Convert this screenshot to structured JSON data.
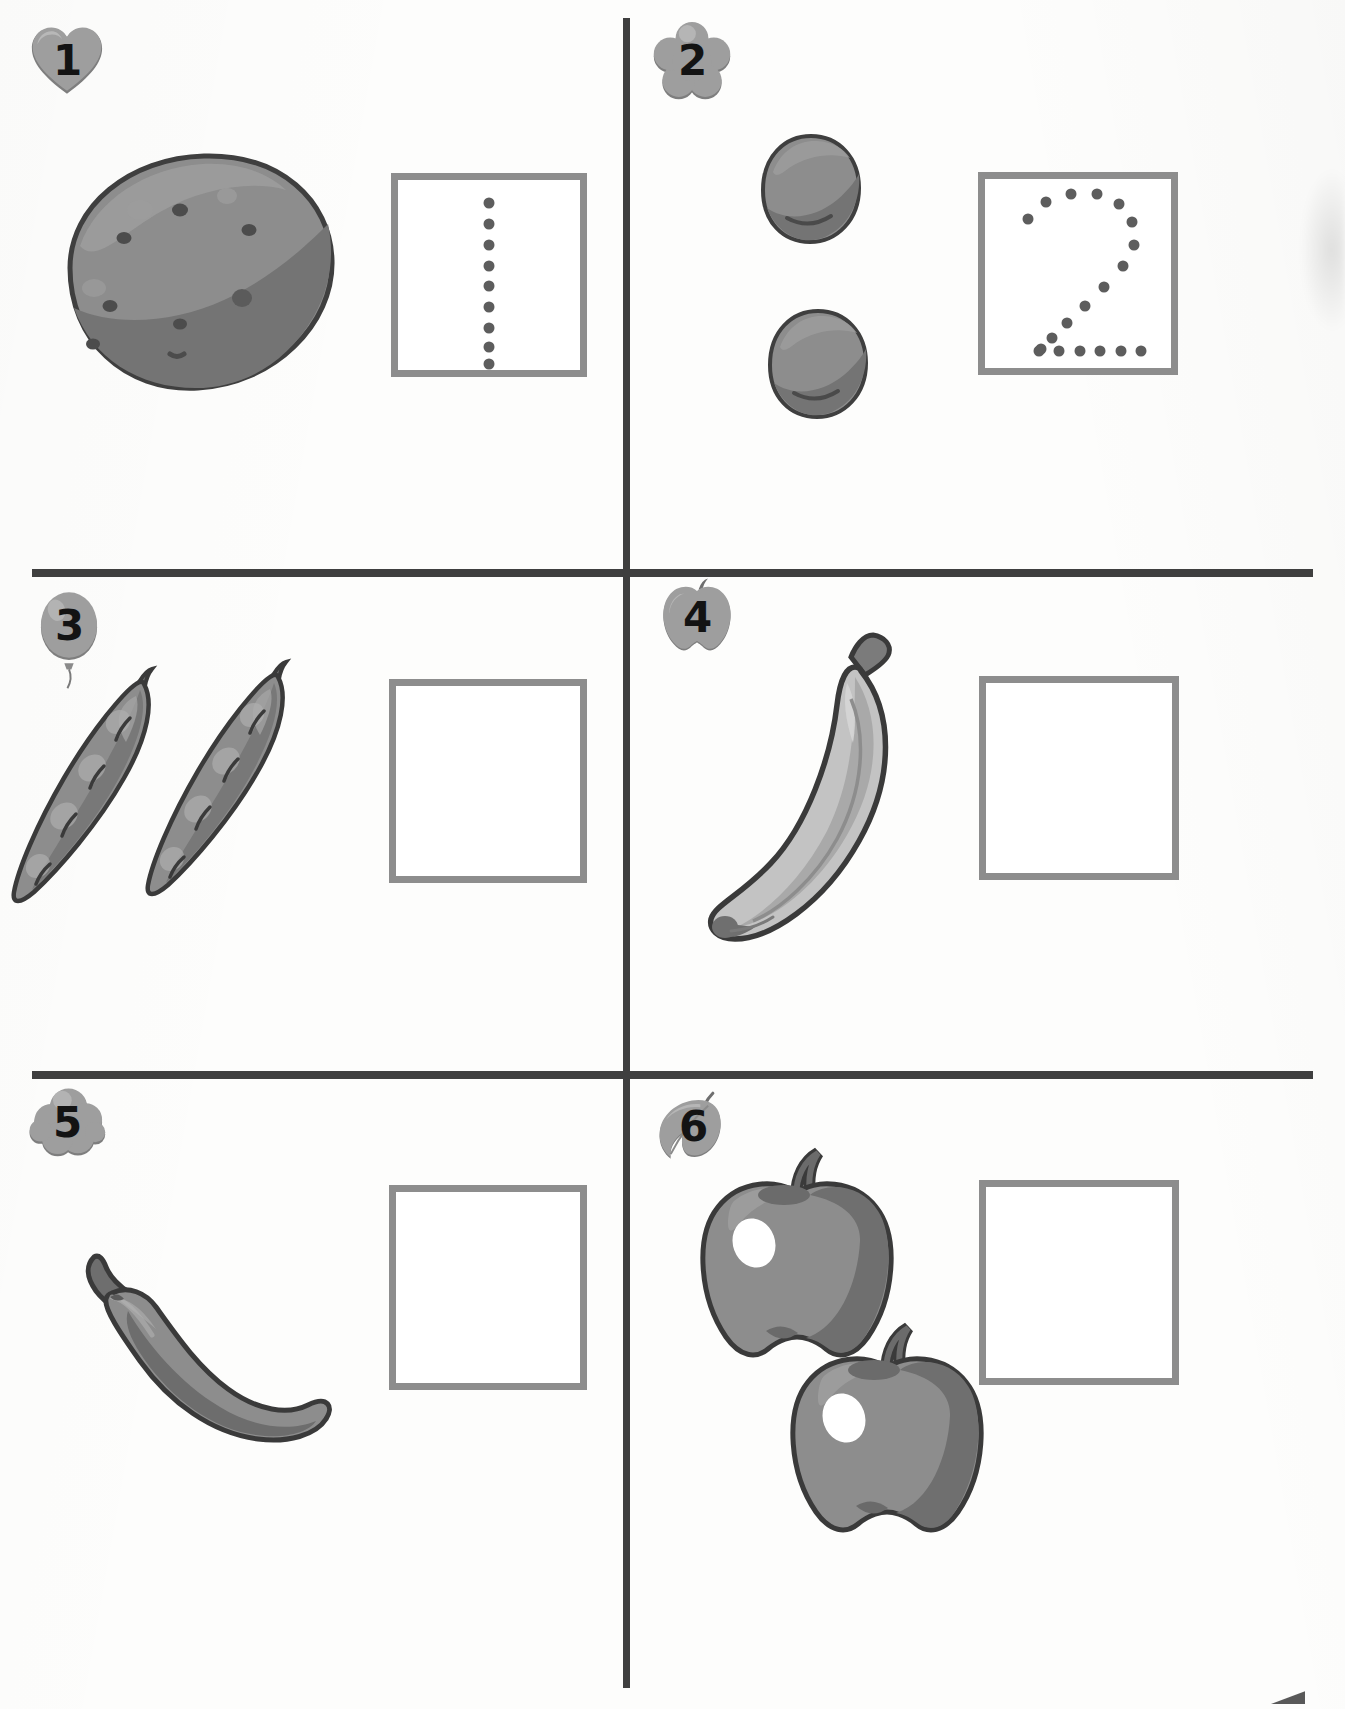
{
  "worksheet": {
    "title": "Count and write the number",
    "columns": 2,
    "rows": 3,
    "colors": {
      "rule": "#3f3f3f",
      "box_border": "#8d8d8d",
      "trace_dot": "#5d5d5d",
      "badge_fill": "#9a9a9a",
      "badge_light": "#b4b4b4",
      "badge_shadow": "#7b7b7b",
      "produce_mid": "#8d8d8d",
      "produce_dark": "#6f6f6f",
      "produce_light": "#bdbdbd",
      "outline": "#3a3a3a",
      "paper": "#fdfdfc"
    }
  },
  "cells": [
    {
      "id": "cell-1",
      "number": "1",
      "badge_shape": "heart",
      "item_name": "potato",
      "item_count": 1,
      "box_has_trace": true,
      "trace_digit": "1",
      "trace_dots": [
        [
          50,
          12
        ],
        [
          50,
          23
        ],
        [
          50,
          34
        ],
        [
          50,
          45
        ],
        [
          50,
          56
        ],
        [
          50,
          67
        ],
        [
          50,
          78
        ],
        [
          50,
          88
        ],
        [
          50,
          97
        ]
      ]
    },
    {
      "id": "cell-2",
      "number": "2",
      "badge_shape": "flower",
      "item_name": "plum",
      "item_count": 2,
      "box_has_trace": true,
      "trace_digit": "2",
      "trace_dots": [
        [
          23,
          21
        ],
        [
          33,
          12
        ],
        [
          46,
          8
        ],
        [
          60,
          8
        ],
        [
          72,
          13
        ],
        [
          79,
          23
        ],
        [
          80,
          35
        ],
        [
          74,
          46
        ],
        [
          64,
          57
        ],
        [
          54,
          67
        ],
        [
          44,
          76
        ],
        [
          36,
          84
        ],
        [
          30,
          90
        ],
        [
          29,
          91
        ],
        [
          40,
          91
        ],
        [
          51,
          91
        ],
        [
          62,
          91
        ],
        [
          73,
          91
        ],
        [
          84,
          91
        ]
      ]
    },
    {
      "id": "cell-3",
      "number": "3",
      "badge_shape": "balloon",
      "item_name": "pea-pod",
      "item_count": 2,
      "box_has_trace": false,
      "trace_digit": "",
      "trace_dots": []
    },
    {
      "id": "cell-4",
      "number": "4",
      "badge_shape": "apple",
      "item_name": "banana",
      "item_count": 1,
      "box_has_trace": false,
      "trace_digit": "",
      "trace_dots": []
    },
    {
      "id": "cell-5",
      "number": "5",
      "badge_shape": "cloud",
      "item_name": "chili-pepper",
      "item_count": 1,
      "box_has_trace": false,
      "trace_digit": "",
      "trace_dots": []
    },
    {
      "id": "cell-6",
      "number": "6",
      "badge_shape": "leaf",
      "item_name": "apple",
      "item_count": 2,
      "box_has_trace": false,
      "trace_digit": "",
      "trace_dots": []
    }
  ]
}
